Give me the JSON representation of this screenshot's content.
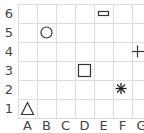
{
  "grid": {
    "columns": [
      "A",
      "B",
      "C",
      "D",
      "E",
      "F",
      "G"
    ],
    "rows": [
      "6",
      "5",
      "4",
      "3",
      "2",
      "1"
    ],
    "line_color": "#dcdcdc",
    "label_color": "#444444"
  },
  "shapes": [
    {
      "type": "circle",
      "name": "circle",
      "cell": "B5"
    },
    {
      "type": "rectangle",
      "name": "small-rectangle",
      "cell": "E6"
    },
    {
      "type": "plus",
      "name": "plus",
      "cell": "G4"
    },
    {
      "type": "square",
      "name": "square",
      "cell": "D3"
    },
    {
      "type": "asterisk",
      "name": "asterisk",
      "cell": "F2"
    },
    {
      "type": "triangle",
      "name": "triangle",
      "cell": "A1"
    }
  ],
  "shape_color": "#333333"
}
